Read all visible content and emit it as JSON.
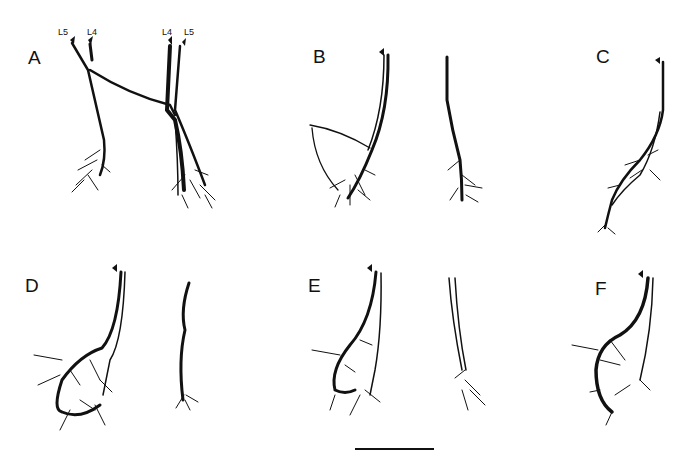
{
  "panels": [
    {
      "id": "A",
      "label": "A",
      "x": 28,
      "y": 48
    },
    {
      "id": "B",
      "label": "B",
      "x": 313,
      "y": 47
    },
    {
      "id": "C",
      "label": "C",
      "x": 596,
      "y": 47
    },
    {
      "id": "D",
      "label": "D",
      "x": 25,
      "y": 276
    },
    {
      "id": "E",
      "label": "E",
      "x": 308,
      "y": 276
    },
    {
      "id": "F",
      "label": "F",
      "x": 595,
      "y": 279
    }
  ],
  "root_labels": [
    {
      "text": "L5",
      "x": 57,
      "y": 27
    },
    {
      "text": "L4",
      "x": 87,
      "y": 27
    },
    {
      "text": "L4",
      "x": 163,
      "y": 27
    },
    {
      "text": "L5",
      "x": 185,
      "y": 27
    }
  ],
  "scale_bar": {
    "x1": 355,
    "x2": 434,
    "y": 449
  }
}
